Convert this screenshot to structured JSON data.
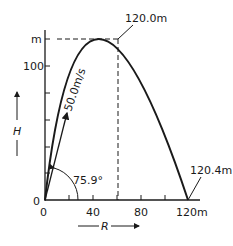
{
  "diagram": {
    "y_axis": {
      "label": "H",
      "unit_label": "m",
      "ticks": [
        "0",
        "100"
      ]
    },
    "x_axis": {
      "label": "R",
      "origin_label": "0",
      "ticks": [
        "0",
        "40",
        "80",
        "120m"
      ]
    },
    "annotations": {
      "max_height": "120.0m",
      "range": "120.4m",
      "velocity": "50.0m/s",
      "angle": "75.9°"
    },
    "colors": {
      "line": "#1a1a1a",
      "background": "#ffffff"
    }
  }
}
